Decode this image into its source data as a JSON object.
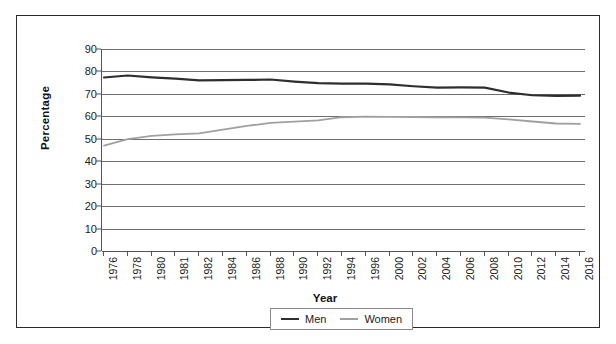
{
  "chart_data": {
    "type": "line",
    "title": "",
    "xlabel": "Year",
    "ylabel": "Percentage",
    "ylim": [
      0,
      90
    ],
    "ytick_step": 10,
    "yticks": [
      90,
      80,
      70,
      60,
      50,
      40,
      30,
      20,
      10,
      0
    ],
    "grid": true,
    "legend_position": "bottom-center",
    "categories": [
      "1976",
      "1978",
      "1980",
      "1981",
      "1982",
      "1984",
      "1986",
      "1988",
      "1990",
      "1992",
      "1994",
      "1996",
      "2000",
      "2002",
      "2004",
      "2006",
      "2008",
      "2010",
      "2012",
      "2014",
      "2016"
    ],
    "series": [
      {
        "name": "Men",
        "color": "#2e2e2e",
        "values": [
          77.3,
          78.2,
          77.4,
          76.8,
          76.0,
          76.1,
          76.2,
          76.4,
          75.5,
          74.8,
          74.6,
          74.6,
          74.2,
          73.4,
          72.8,
          72.9,
          72.8,
          70.6,
          69.4,
          69.1,
          69.2
        ]
      },
      {
        "name": "Women",
        "color": "#a0a0a0",
        "values": [
          47.0,
          49.8,
          51.3,
          52.0,
          52.4,
          54.1,
          55.7,
          57.1,
          57.6,
          58.2,
          59.6,
          59.9,
          59.8,
          59.7,
          59.6,
          59.5,
          59.4,
          58.6,
          57.7,
          56.8,
          56.6
        ]
      }
    ]
  }
}
